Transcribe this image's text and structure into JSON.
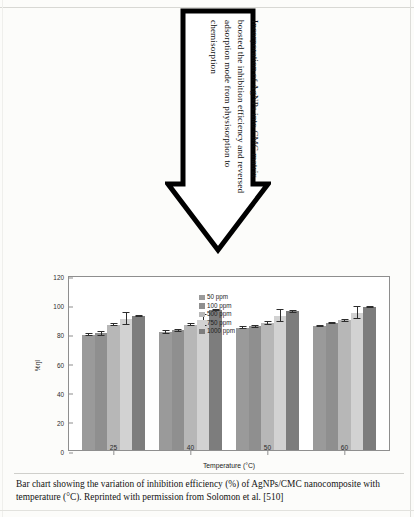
{
  "callout": {
    "text": "Incorporation of AgNPs into CMC matrix boosted the inhibition efficiency and reversed adsorption mode from physisorption to chemisorption"
  },
  "caption": {
    "text": "Bar chart showing the variation of inhibition efficiency (%) of AgNPs/CMC nanocomposite with temperature (°C). Reprinted with permission from Solomon et al. [510]"
  },
  "chart_data": {
    "type": "bar",
    "title": "",
    "xlabel": "Temperature (°C)",
    "ylabel": "%ŋI",
    "categories": [
      "25",
      "40",
      "50",
      "60"
    ],
    "ylim": [
      0,
      120
    ],
    "yticks": [
      0,
      20,
      40,
      60,
      80,
      100,
      120
    ],
    "grid": false,
    "legend_position": "top-center",
    "series": [
      {
        "name": "50 ppm",
        "color": "#9a9a9a",
        "values": [
          79,
          81,
          84,
          85
        ],
        "errors": [
          1.0,
          1.2,
          1.0,
          0.8
        ]
      },
      {
        "name": "100 ppm",
        "color": "#8f8f8f",
        "values": [
          80,
          82,
          85,
          87
        ],
        "errors": [
          1.5,
          1.0,
          1.0,
          0.9
        ]
      },
      {
        "name": "500 ppm",
        "color": "#b7b7b7",
        "values": [
          86,
          86,
          87,
          89
        ],
        "errors": [
          1.0,
          1.2,
          1.5,
          1.0
        ]
      },
      {
        "name": "750 ppm",
        "color": "#d2d2d2",
        "values": [
          90,
          89,
          92,
          94
        ],
        "errors": [
          4.5,
          4.0,
          4.5,
          4.5
        ]
      },
      {
        "name": "1000 ppm",
        "color": "#7d7d7d",
        "values": [
          92,
          96,
          95,
          98
        ],
        "errors": [
          0.8,
          0.8,
          0.8,
          0.8
        ]
      }
    ]
  }
}
